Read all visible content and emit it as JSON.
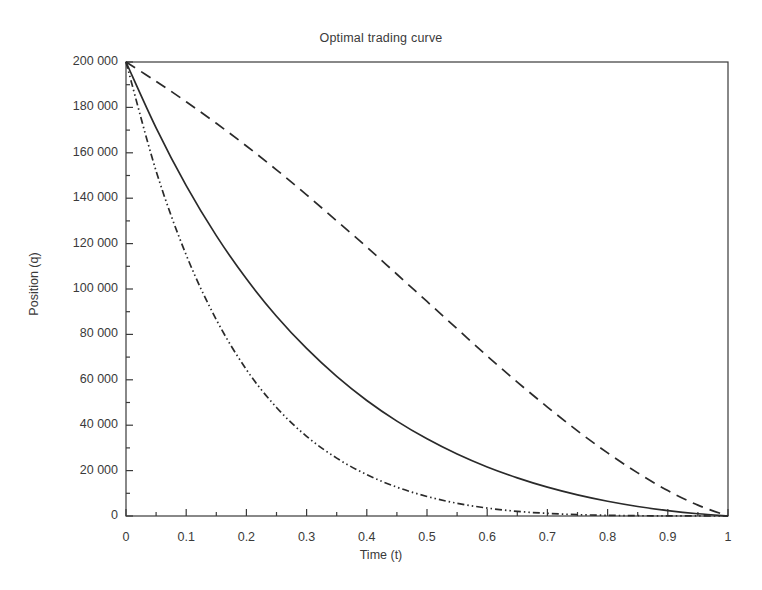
{
  "figure": {
    "title": "Optimal trading curve",
    "background_color": "#ffffff",
    "frame_color": "#3a3a3a",
    "text_color": "#3a3a3a"
  },
  "axes": {
    "x_label": "Time (t)",
    "y_label": "Position (q)",
    "x_ticks": [
      "0",
      "0.1",
      "0.2",
      "0.3",
      "0.4",
      "0.5",
      "0.6",
      "0.7",
      "0.8",
      "0.9",
      "1"
    ],
    "y_ticks": [
      "0",
      "20 000",
      "40 000",
      "60 000",
      "80 000",
      "100 000",
      "120 000",
      "140 000",
      "160 000",
      "180 000",
      "200 000"
    ]
  },
  "chart_data": {
    "type": "line",
    "title": "Optimal trading curve",
    "xlabel": "Time (t)",
    "ylabel": "Position (q)",
    "xlim": [
      0,
      1
    ],
    "ylim": [
      0,
      200000
    ],
    "xticks": [
      0,
      0.1,
      0.2,
      0.3,
      0.4,
      0.5,
      0.6,
      0.7,
      0.8,
      0.9,
      1
    ],
    "yticks": [
      0,
      20000,
      40000,
      60000,
      80000,
      100000,
      120000,
      140000,
      160000,
      180000,
      200000
    ],
    "x_minor_tick_step": 0.05,
    "y_minor_tick_step": 10000,
    "grid": false,
    "legend": "none",
    "x": [
      0,
      0.05,
      0.1,
      0.15,
      0.2,
      0.25,
      0.3,
      0.35,
      0.4,
      0.45,
      0.5,
      0.55,
      0.6,
      0.65,
      0.7,
      0.75,
      0.8,
      0.85,
      0.9,
      0.95,
      1
    ],
    "series": [
      {
        "name": "high-urgency",
        "style": "dash-dot-dot",
        "color": "#2a2a2a",
        "values": [
          200000,
          152000,
          115000,
          86500,
          64500,
          47800,
          35100,
          25500,
          18200,
          12700,
          8600,
          5600,
          3500,
          2050,
          1150,
          600,
          290,
          130,
          55,
          18,
          0
        ]
      },
      {
        "name": "medium-urgency",
        "style": "solid",
        "color": "#2a2a2a",
        "values": [
          200000,
          171000,
          145500,
          123500,
          104500,
          88000,
          73800,
          61500,
          50900,
          41800,
          34000,
          27300,
          21600,
          16800,
          12700,
          9300,
          6500,
          4200,
          2400,
          1000,
          0
        ]
      },
      {
        "name": "low-urgency",
        "style": "dashed",
        "color": "#2a2a2a",
        "values": [
          200000,
          191500,
          182500,
          173000,
          163000,
          152500,
          141500,
          130000,
          118500,
          106500,
          94500,
          82500,
          70500,
          59000,
          48000,
          37500,
          27800,
          19000,
          11200,
          4800,
          0
        ]
      }
    ]
  }
}
